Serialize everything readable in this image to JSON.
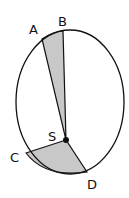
{
  "diagram": {
    "labels": {
      "A": "A",
      "B": "B",
      "C": "C",
      "D": "D",
      "S": "S"
    },
    "colors": {
      "background": "#ffffff",
      "stroke": "#111111",
      "shaded": "#c8c8c8"
    }
  }
}
